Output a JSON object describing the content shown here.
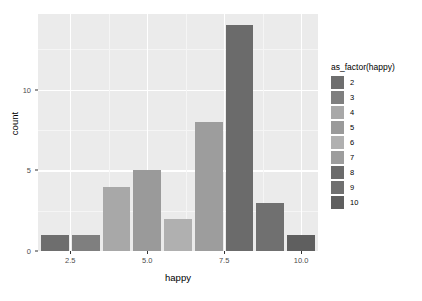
{
  "chart_data": {
    "type": "bar",
    "title": "",
    "xlabel": "happy",
    "ylabel": "count",
    "categories": [
      "2",
      "3",
      "4",
      "5",
      "6",
      "7",
      "8",
      "9",
      "10"
    ],
    "x": [
      2,
      3,
      4,
      5,
      6,
      7,
      8,
      9,
      10
    ],
    "values": [
      1,
      1,
      4,
      5,
      2,
      8,
      14,
      3,
      1
    ],
    "bar_colors": [
      "#6e6e6e",
      "#7f7f7f",
      "#a8a8a8",
      "#9a9a9a",
      "#b0b0b0",
      "#9d9d9d",
      "#6b6b6b",
      "#707070",
      "#5f5f5f"
    ],
    "xlim": [
      1.45,
      10.55
    ],
    "ylim": [
      0,
      14.7
    ],
    "x_ticks": [
      2.5,
      5.0,
      7.5,
      10.0
    ],
    "x_tick_labels": [
      "2.5",
      "5.0",
      "7.5",
      "10.0"
    ],
    "x_minor_ticks": [
      3.75,
      6.25,
      8.75
    ],
    "y_ticks": [
      0,
      5,
      10
    ],
    "y_tick_labels": [
      "0",
      "5",
      "10"
    ],
    "y_minor_ticks": [
      2.5,
      7.5,
      12.5
    ],
    "grid": true,
    "panel_background": "#ebebeb",
    "grid_color": "#ffffff",
    "legend": {
      "position": "right",
      "title": "as_factor(happy)",
      "entries": [
        {
          "label": "2",
          "color": "#6e6e6e"
        },
        {
          "label": "3",
          "color": "#7f7f7f"
        },
        {
          "label": "4",
          "color": "#a8a8a8"
        },
        {
          "label": "5",
          "color": "#9a9a9a"
        },
        {
          "label": "6",
          "color": "#b0b0b0"
        },
        {
          "label": "7",
          "color": "#9d9d9d"
        },
        {
          "label": "8",
          "color": "#6b6b6b"
        },
        {
          "label": "9",
          "color": "#707070"
        },
        {
          "label": "10",
          "color": "#5f5f5f"
        }
      ]
    }
  }
}
